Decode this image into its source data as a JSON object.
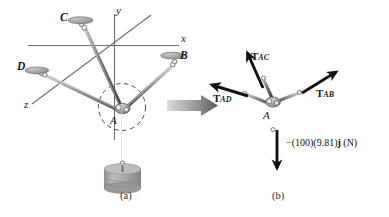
{
  "figure": {
    "panels": [
      {
        "id": "a",
        "caption": "(a)",
        "caption_x": 120,
        "caption_y": 196
      },
      {
        "id": "b",
        "caption": "(b)",
        "caption_x": 272,
        "caption_y": 196
      }
    ]
  },
  "panel_a": {
    "axes": [
      {
        "name": "x-axis",
        "label": "x",
        "label_x": 181,
        "label_y": 40
      },
      {
        "name": "y-axis",
        "label": "y",
        "label_x": 116,
        "label_y": 8
      },
      {
        "name": "z-axis",
        "label": "z",
        "label_x": 25,
        "label_y": 100
      }
    ],
    "joint_label": "A",
    "joint_label_x": 110,
    "joint_label_y": 114,
    "anchors": [
      {
        "name": "anchor-b",
        "label": "B",
        "label_x": 182,
        "label_y": 57
      },
      {
        "name": "anchor-c",
        "label": "C",
        "label_x": 60,
        "label_y": 15
      },
      {
        "name": "anchor-d",
        "label": "D",
        "label_x": 18,
        "label_y": 64
      }
    ],
    "suspended_weight_name": "cylindrical-weight"
  },
  "panel_b": {
    "joint_label": "A",
    "joint_label_x": 264,
    "joint_label_y": 112,
    "forces": [
      {
        "name": "tension-ac",
        "symbol": "T",
        "subscript": "AC",
        "label_x": 253,
        "label_y": 55
      },
      {
        "name": "tension-ab",
        "symbol": "T",
        "subscript": "AB",
        "label_x": 318,
        "label_y": 93
      },
      {
        "name": "tension-ad",
        "symbol": "T",
        "subscript": "AD",
        "label_x": 216,
        "label_y": 98
      }
    ],
    "weight_force": {
      "name": "weight-force",
      "prefix": "−(100)(9.81)",
      "vector": "j",
      "units": " (N)",
      "label_x": 289,
      "label_y": 142
    }
  },
  "transition_arrow": {
    "name": "transition-arrow",
    "x": 167,
    "y": 96
  },
  "colors": {
    "axis": "#6b6b6b",
    "cable": "#8a8a8a",
    "cable_dark": "#4a4a4a",
    "ring": "#9a9a9a",
    "disc": "#a8a8a8",
    "weight_body": "#a9a9a9",
    "arrow_black": "#121212",
    "arrow_gray_start": "#d4d4d4",
    "arrow_gray_end": "#5e5e5e",
    "text": "#1a1a1a",
    "background": "#ffffff"
  }
}
